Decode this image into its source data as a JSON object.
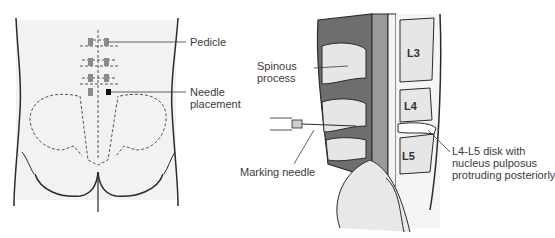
{
  "figure": {
    "left_panel": {
      "view": "posterior-back",
      "labels": {
        "pedicle": "Pedicle",
        "needle_line1": "Needle",
        "needle_line2": "placement"
      }
    },
    "right_panel": {
      "view": "sagittal-lumbar-spine",
      "labels": {
        "spinous_line1": "Spinous",
        "spinous_line2": "process",
        "marking_needle": "Marking needle",
        "disk_line1": "L4-L5 disk with",
        "disk_line2": "nucleus pulposus",
        "disk_line3": "protruding posteriorly"
      },
      "vertebrae": [
        "L3",
        "L4",
        "L5"
      ]
    },
    "colors": {
      "line": "#2a2a2a",
      "muscle": "#6e6e6e",
      "bone": "#e6e6e6",
      "shading": "#efefef",
      "text": "#3a3a3a"
    }
  }
}
